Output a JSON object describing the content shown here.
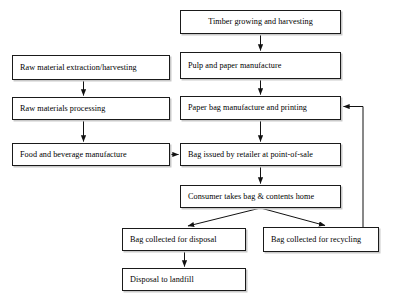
{
  "diagram": {
    "style": {
      "background": "#ffffff",
      "box_border": "#1a1a1a",
      "box_fill": "#ffffff",
      "box_shadow": "#c9c9c9",
      "connector": "#1a1a1a",
      "text": "#000000"
    },
    "nodes": [
      {
        "id": "timber",
        "label": "Timber growing and harvesting",
        "x": 180,
        "y": 10,
        "w": 161,
        "h": 24,
        "align": "center"
      },
      {
        "id": "raw-extraction",
        "label": "Raw material extraction/harvesting",
        "x": 12,
        "y": 55,
        "w": 158,
        "h": 25,
        "align": "left"
      },
      {
        "id": "pulp-paper",
        "label": "Pulp and paper manufacture",
        "x": 180,
        "y": 52,
        "w": 161,
        "h": 27,
        "align": "left"
      },
      {
        "id": "raw-processing",
        "label": "Raw materials processing",
        "x": 12,
        "y": 97,
        "w": 158,
        "h": 23,
        "align": "left"
      },
      {
        "id": "paper-bag",
        "label": "Paper bag manufacture and printing",
        "x": 180,
        "y": 96,
        "w": 161,
        "h": 24,
        "align": "left"
      },
      {
        "id": "food-beverage",
        "label": "Food and beverage manufacture",
        "x": 12,
        "y": 143,
        "w": 158,
        "h": 23,
        "align": "left"
      },
      {
        "id": "bag-issued",
        "label": "Bag issued by retailer at point-of-sale",
        "x": 180,
        "y": 143,
        "w": 161,
        "h": 23,
        "align": "left"
      },
      {
        "id": "consumer",
        "label": "Consumer takes bag & contents home",
        "x": 180,
        "y": 185,
        "w": 161,
        "h": 23,
        "align": "left"
      },
      {
        "id": "bag-disposal",
        "label": "Bag collected for disposal",
        "x": 122,
        "y": 228,
        "w": 124,
        "h": 23,
        "align": "left"
      },
      {
        "id": "bag-recycling",
        "label": "Bag collected for recycling",
        "x": 263,
        "y": 227,
        "w": 116,
        "h": 25,
        "align": "left"
      },
      {
        "id": "landfill",
        "label": "Disposal to landfill",
        "x": 122,
        "y": 268,
        "w": 124,
        "h": 23,
        "align": "left"
      }
    ],
    "connectors": [
      {
        "id": "timber-to-pulp",
        "from": "timber",
        "to": "pulp-paper",
        "kind": "vertical-arrow"
      },
      {
        "id": "extraction-to-processing",
        "from": "raw-extraction",
        "to": "raw-processing",
        "kind": "vertical-arrow"
      },
      {
        "id": "pulp-to-paperbag",
        "from": "pulp-paper",
        "to": "paper-bag",
        "kind": "vertical-arrow"
      },
      {
        "id": "processing-to-food",
        "from": "raw-processing",
        "to": "food-beverage",
        "kind": "vertical-arrow"
      },
      {
        "id": "paperbag-to-issued",
        "from": "paper-bag",
        "to": "bag-issued",
        "kind": "vertical-arrow"
      },
      {
        "id": "food-to-issued",
        "from": "food-beverage",
        "to": "bag-issued",
        "kind": "horizontal-arrow"
      },
      {
        "id": "issued-to-consumer",
        "from": "bag-issued",
        "to": "consumer",
        "kind": "vertical-arrow"
      },
      {
        "id": "consumer-to-disposal",
        "from": "consumer",
        "to": "bag-disposal",
        "kind": "diagonal-arrow"
      },
      {
        "id": "consumer-to-recycling",
        "from": "consumer",
        "to": "bag-recycling",
        "kind": "diagonal-arrow"
      },
      {
        "id": "disposal-to-landfill",
        "from": "bag-disposal",
        "to": "landfill",
        "kind": "vertical-arrow"
      },
      {
        "id": "recycling-to-paperbag",
        "from": "bag-recycling",
        "to": "paper-bag",
        "kind": "feedback-loop"
      }
    ]
  }
}
